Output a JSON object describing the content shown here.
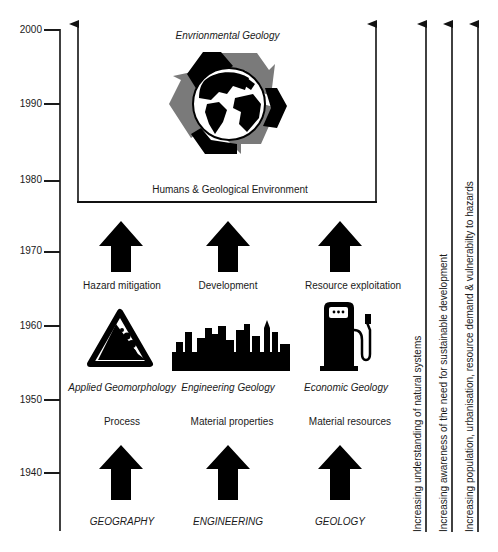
{
  "diagram": {
    "type": "timeline-flow",
    "timeline": {
      "ticks": [
        "2000",
        "1990",
        "1980",
        "1970",
        "1960",
        "1950",
        "1940"
      ]
    },
    "top_box": {
      "title": "Envrionmental Geology",
      "icon": "recycle-globe-icon",
      "caption": "Humans & Geological Environment"
    },
    "columns": [
      {
        "discipline": "GEOGRAPHY",
        "focus": "Process",
        "field": "Applied Geomorphology",
        "icon": "rockfall-warning-icon",
        "driver": "Hazard mitigation"
      },
      {
        "discipline": "ENGINEERING",
        "focus": "Material properties",
        "field": "Engineering Geology",
        "icon": "city-skyline-icon",
        "driver": "Development"
      },
      {
        "discipline": "GEOLOGY",
        "focus": "Material resources",
        "field": "Economic Geology",
        "icon": "fuel-pump-icon",
        "driver": "Resource exploitation"
      }
    ],
    "trends": [
      "Increasing understanding of natural systems",
      "Increasing awareness of the need for sustainable development",
      "Increasing population, urbanisation, resource demand & vulnerabilty to hazards"
    ],
    "colors": {
      "ink": "#111111",
      "recycle_grey": "#7a7a7a",
      "background": "#ffffff"
    }
  }
}
